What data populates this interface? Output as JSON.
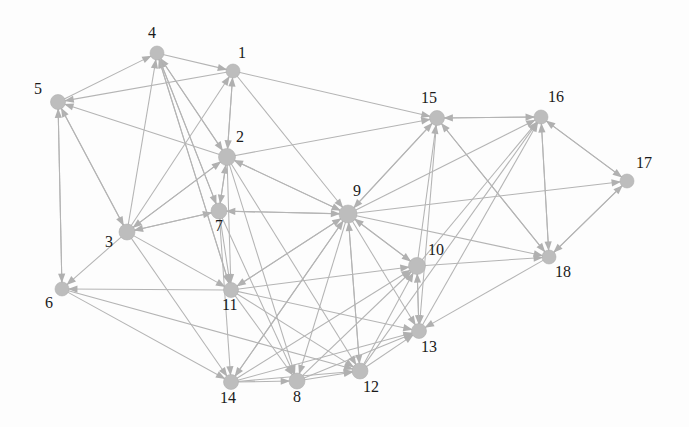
{
  "figure": {
    "kind": "directed-network-graph",
    "width": 689,
    "height": 427,
    "background_color": "#fdfdfd",
    "node_color": "#bdbdbd",
    "edge_color": "#b4b4b4",
    "arrow_color": "#b0b0b0",
    "label_color": "#1a1a1a"
  },
  "chart_data": {
    "type": "scatter",
    "title": "",
    "xlabel": "",
    "ylabel": "",
    "grid": false,
    "legend": "none",
    "node_count": 18,
    "edge_count": 76,
    "nodes": [
      {
        "id": 1,
        "label": "1",
        "x": 233,
        "y": 71,
        "r": 7.0,
        "label_dx": 5,
        "label_dy": -26
      },
      {
        "id": 2,
        "label": "2",
        "x": 227,
        "y": 157,
        "r": 8.5,
        "label_dx": 9,
        "label_dy": -28
      },
      {
        "id": 3,
        "label": "3",
        "x": 127,
        "y": 232,
        "r": 8.0,
        "label_dx": -22,
        "label_dy": 2
      },
      {
        "id": 4,
        "label": "4",
        "x": 157,
        "y": 53,
        "r": 7.0,
        "label_dx": -9,
        "label_dy": -28
      },
      {
        "id": 5,
        "label": "5",
        "x": 58,
        "y": 102,
        "r": 7.5,
        "label_dx": -24,
        "label_dy": -21
      },
      {
        "id": 6,
        "label": "6",
        "x": 62,
        "y": 289,
        "r": 7.0,
        "label_dx": -17,
        "label_dy": 6
      },
      {
        "id": 7,
        "label": "7",
        "x": 219,
        "y": 211,
        "r": 8.0,
        "label_dx": -4,
        "label_dy": 7
      },
      {
        "id": 8,
        "label": "8",
        "x": 297,
        "y": 381,
        "r": 8.0,
        "label_dx": -4,
        "label_dy": 8
      },
      {
        "id": 9,
        "label": "9",
        "x": 348,
        "y": 214,
        "r": 9.0,
        "label_dx": 5,
        "label_dy": -31
      },
      {
        "id": 10,
        "label": "10",
        "x": 417,
        "y": 266,
        "r": 8.5,
        "label_dx": 11,
        "label_dy": -24
      },
      {
        "id": 11,
        "label": "11",
        "x": 231,
        "y": 290,
        "r": 7.5,
        "label_dx": -9,
        "label_dy": 7
      },
      {
        "id": 12,
        "label": "12",
        "x": 360,
        "y": 371,
        "r": 8.0,
        "label_dx": 3,
        "label_dy": 8
      },
      {
        "id": 13,
        "label": "13",
        "x": 419,
        "y": 331,
        "r": 7.5,
        "label_dx": 2,
        "label_dy": 8
      },
      {
        "id": 14,
        "label": "14",
        "x": 231,
        "y": 382,
        "r": 7.5,
        "label_dx": -11,
        "label_dy": 8
      },
      {
        "id": 15,
        "label": "15",
        "x": 437,
        "y": 118,
        "r": 7.5,
        "label_dx": -16,
        "label_dy": -28
      },
      {
        "id": 16,
        "label": "16",
        "x": 541,
        "y": 117,
        "r": 7.0,
        "label_dx": 7,
        "label_dy": -28
      },
      {
        "id": 17,
        "label": "17",
        "x": 627,
        "y": 181,
        "r": 7.0,
        "label_dx": 9,
        "label_dy": -26
      },
      {
        "id": 18,
        "label": "18",
        "x": 549,
        "y": 257,
        "r": 7.0,
        "label_dx": 6,
        "label_dy": 7
      }
    ],
    "edges": [
      {
        "source": 5,
        "target": 4
      },
      {
        "source": 4,
        "target": 1
      },
      {
        "source": 1,
        "target": 5
      },
      {
        "source": 1,
        "target": 2
      },
      {
        "source": 2,
        "target": 1
      },
      {
        "source": 3,
        "target": 4
      },
      {
        "source": 7,
        "target": 4
      },
      {
        "source": 2,
        "target": 4
      },
      {
        "source": 11,
        "target": 4
      },
      {
        "source": 4,
        "target": 2
      },
      {
        "source": 4,
        "target": 7
      },
      {
        "source": 4,
        "target": 11
      },
      {
        "source": 3,
        "target": 1
      },
      {
        "source": 3,
        "target": 2
      },
      {
        "source": 2,
        "target": 3
      },
      {
        "source": 7,
        "target": 2
      },
      {
        "source": 2,
        "target": 7
      },
      {
        "source": 9,
        "target": 2
      },
      {
        "source": 2,
        "target": 5
      },
      {
        "source": 3,
        "target": 5
      },
      {
        "source": 6,
        "target": 5
      },
      {
        "source": 5,
        "target": 3
      },
      {
        "source": 5,
        "target": 6
      },
      {
        "source": 3,
        "target": 6
      },
      {
        "source": 3,
        "target": 7
      },
      {
        "source": 7,
        "target": 3
      },
      {
        "source": 3,
        "target": 11
      },
      {
        "source": 3,
        "target": 14
      },
      {
        "source": 6,
        "target": 14
      },
      {
        "source": 11,
        "target": 6
      },
      {
        "source": 7,
        "target": 11
      },
      {
        "source": 9,
        "target": 7
      },
      {
        "source": 7,
        "target": 9
      },
      {
        "source": 9,
        "target": 11
      },
      {
        "source": 11,
        "target": 9
      },
      {
        "source": 2,
        "target": 9
      },
      {
        "source": 2,
        "target": 15
      },
      {
        "source": 1,
        "target": 15
      },
      {
        "source": 15,
        "target": 9
      },
      {
        "source": 9,
        "target": 15
      },
      {
        "source": 16,
        "target": 15
      },
      {
        "source": 15,
        "target": 16
      },
      {
        "source": 18,
        "target": 15
      },
      {
        "source": 10,
        "target": 15
      },
      {
        "source": 15,
        "target": 18
      },
      {
        "source": 15,
        "target": 13
      },
      {
        "source": 9,
        "target": 16
      },
      {
        "source": 10,
        "target": 16
      },
      {
        "source": 13,
        "target": 16
      },
      {
        "source": 16,
        "target": 17
      },
      {
        "source": 17,
        "target": 16
      },
      {
        "source": 16,
        "target": 18
      },
      {
        "source": 18,
        "target": 16
      },
      {
        "source": 18,
        "target": 17
      },
      {
        "source": 17,
        "target": 18
      },
      {
        "source": 9,
        "target": 17
      },
      {
        "source": 10,
        "target": 18
      },
      {
        "source": 9,
        "target": 18
      },
      {
        "source": 9,
        "target": 10
      },
      {
        "source": 10,
        "target": 9
      },
      {
        "source": 9,
        "target": 13
      },
      {
        "source": 10,
        "target": 13
      },
      {
        "source": 18,
        "target": 13
      },
      {
        "source": 9,
        "target": 12
      },
      {
        "source": 12,
        "target": 9
      },
      {
        "source": 9,
        "target": 8
      },
      {
        "source": 9,
        "target": 14
      },
      {
        "source": 14,
        "target": 9
      },
      {
        "source": 11,
        "target": 12
      },
      {
        "source": 11,
        "target": 13
      },
      {
        "source": 11,
        "target": 8
      },
      {
        "source": 14,
        "target": 8
      },
      {
        "source": 8,
        "target": 12
      },
      {
        "source": 12,
        "target": 13
      },
      {
        "source": 8,
        "target": 13
      },
      {
        "source": 14,
        "target": 12
      },
      {
        "source": 12,
        "target": 10
      },
      {
        "source": 8,
        "target": 10
      },
      {
        "source": 14,
        "target": 10
      },
      {
        "source": 13,
        "target": 10
      },
      {
        "source": 7,
        "target": 14
      },
      {
        "source": 7,
        "target": 8
      },
      {
        "source": 2,
        "target": 11
      },
      {
        "source": 2,
        "target": 12
      },
      {
        "source": 2,
        "target": 8
      },
      {
        "source": 1,
        "target": 9
      },
      {
        "source": 6,
        "target": 12
      },
      {
        "source": 11,
        "target": 10
      },
      {
        "source": 14,
        "target": 13
      },
      {
        "source": 12,
        "target": 16
      }
    ]
  }
}
